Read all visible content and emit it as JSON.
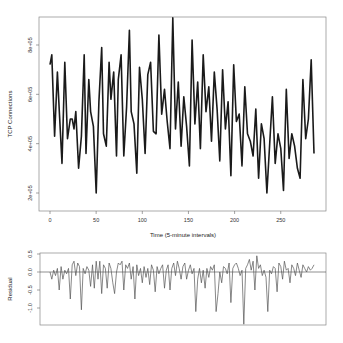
{
  "chart_data": [
    {
      "type": "line",
      "panel": "top",
      "title": "",
      "xlabel": "Time (5-minute intervals)",
      "ylabel": "TCP Connections",
      "xlim": [
        -10,
        295
      ],
      "ylim": [
        0.6,
        9.3
      ],
      "y_unit_multiplier": 100000,
      "x_ticks": [
        0,
        50,
        100,
        150,
        200,
        250
      ],
      "x_tick_labels": [
        "0",
        "50",
        "100",
        "150",
        "200",
        "250"
      ],
      "y_ticks": [
        2,
        4,
        6,
        8
      ],
      "y_tick_labels": [
        "2e+05",
        "4e+05",
        "6e+05",
        "8e+05"
      ],
      "grid": false,
      "legend": null,
      "x": [
        0,
        2,
        5,
        8,
        10,
        13,
        16,
        19,
        22,
        24,
        26,
        28,
        31,
        34,
        37,
        39,
        42,
        44,
        47,
        50,
        53,
        56,
        58,
        61,
        64,
        66,
        69,
        72,
        74,
        77,
        80,
        83,
        86,
        88,
        91,
        94,
        97,
        100,
        103,
        106,
        109,
        112,
        115,
        118,
        121,
        124,
        127,
        130,
        133,
        136,
        139,
        142,
        145,
        148,
        151,
        154,
        157,
        160,
        163,
        166,
        169,
        172,
        175,
        178,
        181,
        184,
        187,
        190,
        193,
        196,
        199,
        202,
        205,
        208,
        211,
        214,
        217,
        220,
        223,
        226,
        229,
        232,
        235,
        238,
        241,
        244,
        247,
        250,
        253,
        256,
        259,
        262,
        265,
        268,
        271,
        274,
        277,
        280,
        283,
        286
      ],
      "values": [
        7.2,
        7.6,
        4.3,
        6.9,
        5.4,
        3.2,
        7.3,
        4.2,
        5.0,
        5.0,
        4.6,
        5.3,
        3.0,
        4.3,
        7.6,
        3.6,
        6.6,
        5.3,
        4.7,
        2.0,
        5.7,
        7.9,
        4.4,
        3.9,
        7.3,
        5.8,
        6.9,
        3.5,
        6.6,
        7.6,
        3.5,
        5.5,
        8.6,
        5.3,
        4.8,
        2.8,
        7.1,
        5.8,
        3.6,
        6.8,
        7.3,
        4.5,
        4.4,
        8.4,
        5.2,
        6.2,
        4.9,
        3.8,
        9.1,
        4.6,
        6.5,
        3.9,
        5.9,
        4.7,
        3.1,
        8.2,
        4.8,
        6.5,
        3.8,
        7.6,
        5.3,
        6.3,
        4.1,
        6.9,
        5.4,
        3.3,
        7.0,
        4.6,
        5.7,
        2.7,
        7.2,
        4.9,
        5.2,
        3.1,
        6.3,
        4.4,
        4.1,
        3.5,
        5.4,
        2.6,
        4.8,
        4.2,
        2.0,
        4.0,
        5.9,
        3.2,
        4.4,
        3.8,
        2.1,
        6.2,
        3.4,
        4.4,
        3.9,
        3.0,
        2.6,
        6.6,
        4.2,
        5.0,
        7.4,
        3.6
      ]
    },
    {
      "type": "line",
      "panel": "bottom",
      "title": "",
      "xlabel": "",
      "ylabel": "Residual",
      "xlim": [
        -10,
        295
      ],
      "ylim": [
        -1.45,
        0.65
      ],
      "y_ticks": [
        0.5,
        0.0,
        -0.5,
        -1.0
      ],
      "y_tick_labels": [
        "0.5",
        "0.0",
        "-0.5",
        "-1.0"
      ],
      "reference_line": 0.0,
      "grid": false,
      "legend": null,
      "x": [
        0,
        2,
        4,
        6,
        8,
        10,
        12,
        14,
        16,
        18,
        20,
        22,
        24,
        26,
        28,
        30,
        32,
        34,
        36,
        38,
        40,
        42,
        44,
        46,
        48,
        50,
        52,
        54,
        56,
        58,
        60,
        62,
        64,
        66,
        68,
        70,
        72,
        74,
        76,
        78,
        80,
        82,
        84,
        86,
        88,
        90,
        92,
        94,
        96,
        98,
        100,
        102,
        104,
        106,
        108,
        110,
        112,
        114,
        116,
        118,
        120,
        122,
        124,
        126,
        128,
        130,
        132,
        134,
        136,
        138,
        140,
        142,
        144,
        146,
        148,
        150,
        152,
        154,
        156,
        158,
        160,
        162,
        164,
        166,
        168,
        170,
        172,
        174,
        176,
        178,
        180,
        182,
        184,
        186,
        188,
        190,
        192,
        194,
        196,
        198,
        200,
        202,
        204,
        206,
        208,
        210,
        212,
        214,
        216,
        218,
        220,
        222,
        224,
        226,
        228,
        230,
        232,
        234,
        236,
        238,
        240,
        242,
        244,
        246,
        248,
        250,
        252,
        254,
        256,
        258,
        260,
        262,
        264,
        266,
        268,
        270,
        272,
        274,
        276,
        278,
        280,
        282,
        284,
        286
      ],
      "values": [
        0.0,
        -0.2,
        0.05,
        -0.1,
        0.1,
        -0.5,
        0.15,
        -0.2,
        0.05,
        -0.05,
        0.1,
        -0.75,
        0.2,
        0.3,
        -0.1,
        0.25,
        0.15,
        -1.05,
        0.1,
        -0.05,
        0.15,
        0.05,
        -0.4,
        0.2,
        -0.45,
        0.3,
        -0.2,
        0.3,
        -0.6,
        0.2,
        0.1,
        -0.45,
        0.25,
        0.1,
        -0.3,
        -0.6,
        0.0,
        0.25,
        0.2,
        0.3,
        -0.5,
        0.2,
        0.1,
        0.25,
        -0.2,
        0.15,
        -0.75,
        0.2,
        -0.1,
        0.1,
        -0.3,
        0.15,
        -0.15,
        0.1,
        -0.35,
        0.2,
        0.05,
        -0.55,
        0.15,
        -0.05,
        0.1,
        0.2,
        -0.45,
        0.05,
        0.2,
        -0.5,
        0.1,
        0.25,
        -0.1,
        0.3,
        0.1,
        -0.2,
        0.15,
        0.25,
        -0.2,
        0.05,
        0.2,
        -0.05,
        0.1,
        -1.1,
        -0.2,
        0.1,
        -0.3,
        0.05,
        -0.45,
        0.1,
        -0.15,
        0.15,
        0.05,
        0.2,
        -1.1,
        -0.6,
        0.0,
        -0.3,
        0.15,
        0.1,
        -0.05,
        0.25,
        -0.85,
        0.1,
        0.2,
        0.25,
        0.1,
        -0.1,
        0.05,
        -1.45,
        0.1,
        0.2,
        0.35,
        0.05,
        0.3,
        -0.5,
        0.45,
        0.1,
        0.2,
        -0.1,
        0.05,
        -0.15,
        -1.1,
        0.05,
        -0.05,
        0.15,
        0.1,
        -0.55,
        0.25,
        0.15,
        -0.2,
        0.3,
        0.05,
        0.1,
        -0.3,
        0.2,
        0.1,
        -0.1,
        0.25,
        0.05,
        -0.15,
        0.2,
        0.1,
        0.0,
        0.15,
        0.05,
        0.1,
        0.2
      ]
    }
  ],
  "top_panel": {
    "ylabel": "TCP Connections",
    "xlabel": "Time (5-minute intervals)"
  },
  "bottom_panel": {
    "ylabel": "Residual"
  },
  "colors": {
    "line": "#1a1a1a",
    "residual_line": "#555555",
    "frame": "#888888",
    "zero_line": "#444444"
  }
}
